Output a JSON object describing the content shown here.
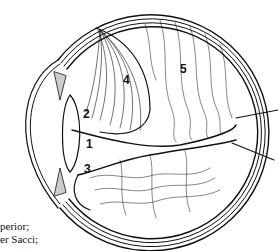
{
  "figure": {
    "type": "anatomical line drawing",
    "stroke_color": "#111111",
    "background": "#ffffff",
    "labels": [
      {
        "id": "1",
        "text": "1",
        "x": 86,
        "y": 138
      },
      {
        "id": "2",
        "text": "2",
        "x": 83,
        "y": 108
      },
      {
        "id": "3",
        "text": "3",
        "x": 84,
        "y": 163
      },
      {
        "id": "4",
        "text": "4",
        "x": 123,
        "y": 74
      },
      {
        "id": "5",
        "text": "5",
        "x": 180,
        "y": 63
      }
    ]
  },
  "caption": {
    "line1": "perior;",
    "line2": "er Sacci;"
  }
}
